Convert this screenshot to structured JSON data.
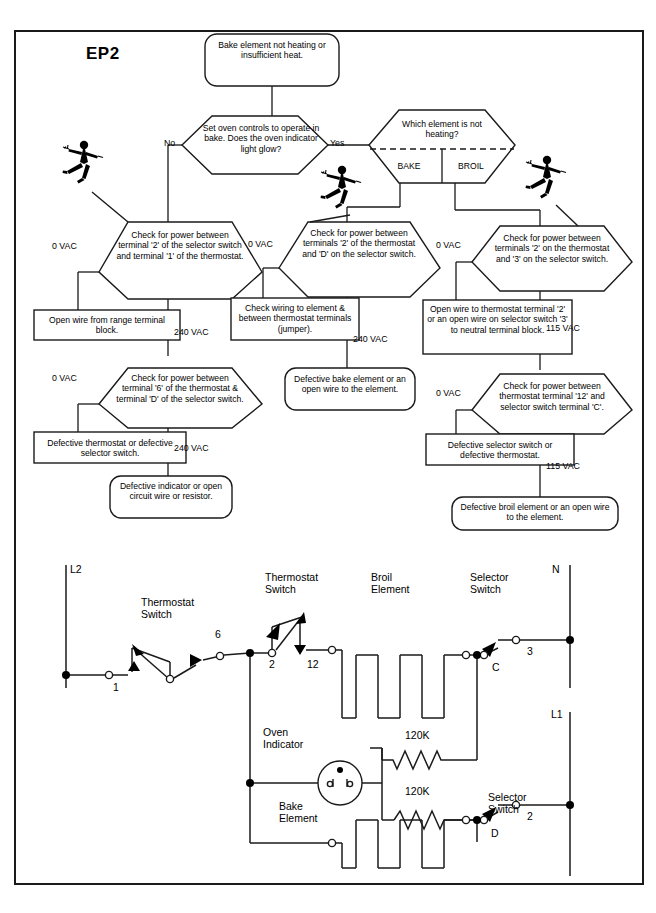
{
  "page": {
    "chart_code": "EP2"
  },
  "flowchart": {
    "start": {
      "id": "start",
      "shape": "rounded",
      "text": "Bake element not heating or insufficient heat."
    },
    "decisions": [
      {
        "id": "d1",
        "shape": "hexagon",
        "text": "Set oven controls to operate in bake. Does the oven indicator light glow?",
        "branch_left": "No",
        "branch_right": "Yes"
      },
      {
        "id": "d2",
        "shape": "hexagon-split",
        "text": "Which element is not heating?",
        "option_left": "BAKE",
        "option_right": "BROIL"
      },
      {
        "id": "d3",
        "shape": "hexagon",
        "text": "Check for power between terminal '2' of the selector switch and terminal '1' of the thermostat.",
        "branch_left": "0 VAC",
        "branch_down": "240 VAC"
      },
      {
        "id": "d4",
        "shape": "hexagon",
        "text": "Check for power between terminals '2' of the thermostat and 'D' on the selector switch.",
        "branch_left": "0 VAC",
        "branch_down": "240 VAC"
      },
      {
        "id": "d5",
        "shape": "hexagon",
        "text": "Check for power between terminals '2' on the thermostat and '3' on the selector switch.",
        "branch_left": "0 VAC",
        "branch_down": "115 VAC"
      },
      {
        "id": "d6",
        "shape": "hexagon",
        "text": "Check for power between terminal '6' of the thermostat & terminal 'D' of the selector switch.",
        "branch_left": "0 VAC",
        "branch_down": "240 VAC"
      },
      {
        "id": "d7",
        "shape": "hexagon",
        "text": "Check for power between thermostat terminal '12' and selector switch terminal 'C'.",
        "branch_left": "0 VAC",
        "branch_down": "115 VAC"
      }
    ],
    "outcomes": [
      {
        "id": "o1",
        "shape": "rect",
        "text": "Open wire from range terminal block."
      },
      {
        "id": "o2",
        "shape": "rect",
        "text": "Check wiring to element & between thermostat terminals (jumper)."
      },
      {
        "id": "o3",
        "shape": "rect",
        "text": "Open wire to thermostat terminal '2' or an open wire on selector switch '3' to neutral terminal block."
      },
      {
        "id": "o4",
        "shape": "rounded",
        "text": "Defective bake element or an open wire to the element."
      },
      {
        "id": "o5",
        "shape": "rect",
        "text": "Defective thermostat or defective selector switch."
      },
      {
        "id": "o6",
        "shape": "rounded",
        "text": "Defective indicator or open circuit wire or resistor."
      },
      {
        "id": "o7",
        "shape": "rect",
        "text": "Defective selector switch or defective thermostat."
      },
      {
        "id": "o8",
        "shape": "rounded",
        "text": "Defective broil element or an open wire to the element."
      }
    ],
    "hazard_icons": [
      {
        "id": "h1",
        "name": "electric-shock-hazard-icon"
      },
      {
        "id": "h2",
        "name": "electric-shock-hazard-icon"
      },
      {
        "id": "h3",
        "name": "electric-shock-hazard-icon"
      }
    ]
  },
  "circuit": {
    "rails": [
      {
        "id": "L2",
        "label": "L2"
      },
      {
        "id": "N",
        "label": "N"
      },
      {
        "id": "L1",
        "label": "L1"
      }
    ],
    "components": [
      {
        "id": "ts1",
        "label": "Thermostat Switch",
        "terminals": [
          "1",
          "6"
        ]
      },
      {
        "id": "ts2",
        "label": "Thermostat Switch",
        "terminals": [
          "2",
          "12"
        ]
      },
      {
        "id": "broil",
        "label": "Broil Element"
      },
      {
        "id": "sel_top",
        "label": "Selector Switch",
        "terminals": [
          "C",
          "3"
        ]
      },
      {
        "id": "indicator",
        "label": "Oven Indicator"
      },
      {
        "id": "r1",
        "label": "120K"
      },
      {
        "id": "r2",
        "label": "120K"
      },
      {
        "id": "bake",
        "label": "Bake Element"
      },
      {
        "id": "sel_bot",
        "label": "Selector Switch",
        "terminals": [
          "D",
          "2"
        ]
      }
    ],
    "terminal_numbers": [
      "1",
      "6",
      "2",
      "12",
      "C",
      "3",
      "D",
      "2"
    ],
    "resistor_values": [
      "120K",
      "120K"
    ]
  },
  "colors": {
    "ink": "#1a1a1a",
    "background": "#ffffff"
  }
}
